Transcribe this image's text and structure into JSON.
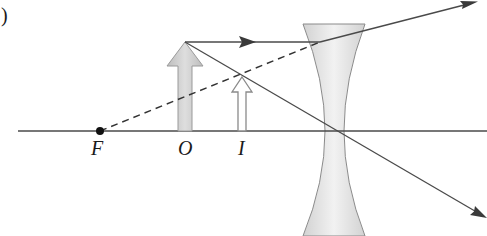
{
  "figure": {
    "part_label": ")"
  },
  "labels": {
    "focal_point": "F",
    "object": "O",
    "image": "I"
  },
  "elements": {
    "optical_axis": {
      "x1": 18,
      "x2": 487,
      "y": 131
    },
    "focal_point": {
      "x": 100,
      "y": 131
    },
    "object_arrow": {
      "x": 185,
      "base_y": 131,
      "tip_y": 42
    },
    "image_arrow": {
      "x": 242,
      "base_y": 131,
      "tip_y": 77
    },
    "lens": {
      "type": "diverging",
      "center_x": 334,
      "top_y": 24,
      "bottom_y": 236,
      "edge_half_width": 31,
      "waist_half_width": 9
    },
    "rays": [
      {
        "name": "parallel-ray",
        "path": [
          [
            185,
            42
          ],
          [
            320,
            42
          ],
          [
            475,
            2
          ]
        ],
        "style": "solid"
      },
      {
        "name": "construction-line",
        "path": [
          [
            100,
            131
          ],
          [
            320,
            42
          ]
        ],
        "style": "dashed"
      },
      {
        "name": "central-ray",
        "path": [
          [
            185,
            42
          ],
          [
            487,
            218
          ]
        ],
        "style": "solid"
      }
    ]
  },
  "colors": {
    "line": "#4a4a4a",
    "object_fill": "#c8c8c8",
    "lens_fill": "#dcdcdc",
    "lens_edge": "#8a8a8a",
    "point": "#111111"
  }
}
